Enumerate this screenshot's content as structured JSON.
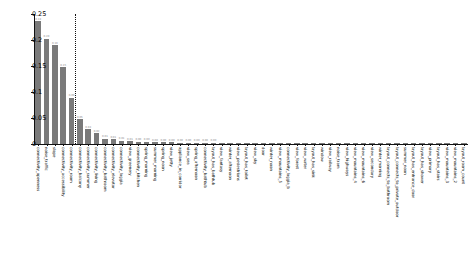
{
  "chart_data": {
    "type": "bar",
    "title": "",
    "xlabel": "",
    "ylabel": "Relative information entropy gain",
    "ylim": [
      0,
      0.25
    ],
    "yticks": [
      "0",
      "0.05",
      "0.1",
      "0.15",
      "0.2",
      "0.25"
    ],
    "ytick_values": [
      0,
      0.05,
      0.1,
      0.15,
      0.2,
      0.25
    ],
    "grid": false,
    "legend": "none",
    "threshold_after_index": 5,
    "categories": [
      "connectivity_openness",
      "noise_traffic",
      "slope",
      "connectivity_accessibility",
      "connectivity_room",
      "connectivity_balcony",
      "connectivity_summer",
      "connectivity_living",
      "connectivity_bathroom",
      "connectivity_elevator",
      "connectivity_loggia",
      "view_greenery",
      "connectivity_kitchen",
      "spring_morning",
      "summer_morning",
      "spring_noon",
      "view_jetty",
      "appliance_in_corridor",
      "view_sea",
      "spring_afternoon",
      "connectivity_bathtub",
      "layout_has_bathtub",
      "view_fantasy",
      "winter_afternoon",
      "view_pedestrians",
      "layout_has_toilet",
      "view_sky",
      "door",
      "winter_noon",
      "view_mountains_5",
      "connectivity_loggia_b",
      "view_forest",
      "view_water",
      "layout_has_sink",
      "window",
      "view_railway",
      "noise_tram",
      "view_highways",
      "view_mountains_4",
      "view_mountains_6",
      "view_secondary",
      "winter_morning",
      "layout_connects_to_bathroom",
      "layout_connects_to_private_outdoor",
      "summer_noon",
      "layout_has_entrance_door",
      "layout_has_shower",
      "view_primary",
      "layout_has_stairs",
      "view_mountains_3",
      "view_mountains_2",
      "layout_room_count"
    ],
    "values": [
      0.236,
      0.202,
      0.19,
      0.148,
      0.089,
      0.048,
      0.028,
      0.021,
      0.01,
      0.009,
      0.006,
      0.005,
      0.004,
      0.004,
      0.003,
      0.003,
      0.003,
      0.002,
      0.002,
      0.002,
      0.002,
      0.002,
      0.0015,
      0.0015,
      0.0015,
      0.0012,
      0.0012,
      0.001,
      0.001,
      0.001,
      0.001,
      0.0008,
      0.0008,
      0.0008,
      0.0007,
      0.0007,
      0.0006,
      0.0006,
      0.0005,
      0.0005,
      0.0005,
      0.0004,
      0.0004,
      0.0004,
      0.0003,
      0.0003,
      0.0003,
      0.0002,
      0.0002,
      0.0002,
      0.0001,
      0.0001
    ],
    "value_labels": [
      "0.24",
      "0.20",
      "0.19",
      "0.15",
      "0.09",
      "0.05",
      "0.03",
      "0.02",
      "0.01",
      "0.01",
      "0.01",
      "0.01",
      "0.00",
      "0.00",
      "0.00",
      "0.00",
      "0.00",
      "0.00",
      "0.00",
      "0.00",
      "0.00",
      "0.00",
      "",
      "",
      "",
      "",
      "",
      "",
      "",
      "",
      "",
      "",
      "",
      "",
      "",
      "",
      "",
      "",
      "",
      "",
      "",
      "",
      "",
      "",
      "",
      "",
      "",
      "",
      "",
      "",
      "",
      ""
    ],
    "bar_color": "#7a7a7a"
  }
}
